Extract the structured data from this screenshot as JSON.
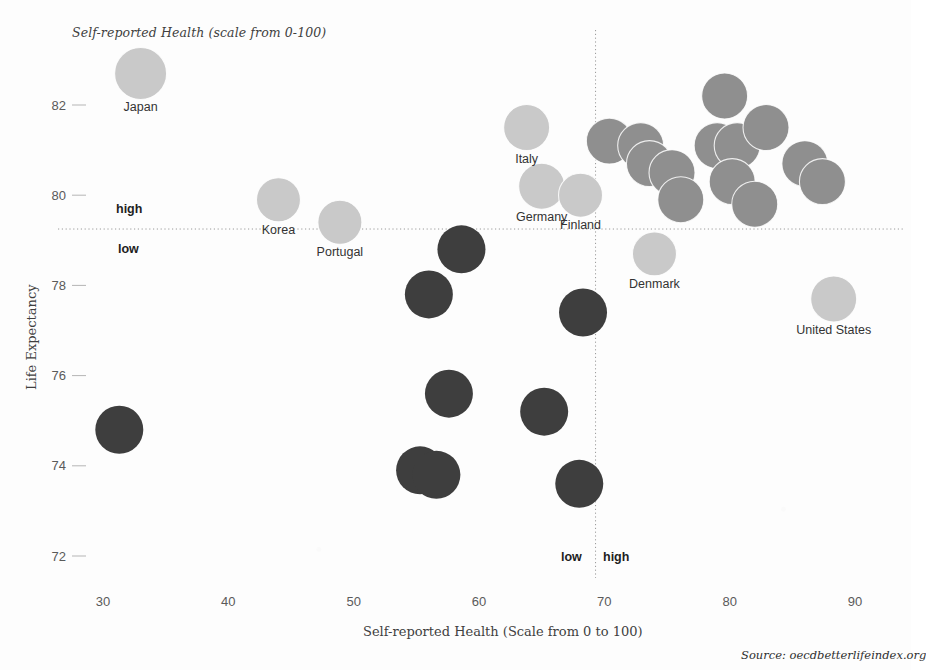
{
  "legend": {
    "bubble_size_note": "Self-reported Health (scale from 0-100)"
  },
  "axes": {
    "x_title": "Self-reported Health (Scale from 0 to 100)",
    "y_title": "Life Expectancy",
    "x_ticks": [
      "30",
      "40",
      "50",
      "60",
      "70",
      "80",
      "90"
    ],
    "y_ticks": [
      "82",
      "80",
      "78",
      "76",
      "74",
      "72"
    ]
  },
  "quadrant_labels": {
    "y_high": "high",
    "y_low": "low",
    "x_low": "low",
    "x_high": "high"
  },
  "footer": {
    "source": "Source: oecdbetterlifeindex.org"
  },
  "colors": {
    "light_bubble": "#c9c9c9",
    "mid_bubble": "#8f8f8f",
    "dark_bubble": "#3e3e3e",
    "reference_line": "#9a9a9a",
    "tick_text": "#5a5a5a",
    "label_text": "#333333",
    "background": "#fdfdfd"
  },
  "chart_data": {
    "type": "scatter",
    "title": "",
    "xlabel": "Self-reported Health (Scale from 0 to 100)",
    "ylabel": "Life Expectancy",
    "xlim": [
      26,
      94
    ],
    "ylim": [
      71.2,
      83.6
    ],
    "grid": false,
    "legend_position": "none",
    "bubble_encoding": "Bubble area encodes Self-reported Health (scale from 0-100)",
    "reference_lines": {
      "x": 69.3,
      "y": 79.25,
      "style": "dotted",
      "note": "OECD average crosshair splitting plot into four quadrants"
    },
    "color_groups": [
      {
        "name": "light",
        "hex": "#c9c9c9",
        "meaning": "high self-reported health / labelled highlight"
      },
      {
        "name": "mid",
        "hex": "#8f8f8f",
        "meaning": "mid range"
      },
      {
        "name": "dark",
        "hex": "#3e3e3e",
        "meaning": "low self-reported health"
      }
    ],
    "points": [
      {
        "label": "Japan",
        "x": 33.0,
        "y": 82.7,
        "r": 26,
        "group": "light",
        "label_pos": "below"
      },
      {
        "label": "Korea",
        "x": 44.0,
        "y": 79.9,
        "r": 22,
        "group": "light",
        "label_pos": "below"
      },
      {
        "label": "Portugal",
        "x": 48.9,
        "y": 79.4,
        "r": 22,
        "group": "light",
        "label_pos": "below"
      },
      {
        "label": "Italy",
        "x": 63.8,
        "y": 81.5,
        "r": 23,
        "group": "light",
        "label_pos": "below"
      },
      {
        "label": "Germany",
        "x": 65.0,
        "y": 80.2,
        "r": 23,
        "group": "light",
        "label_pos": "below"
      },
      {
        "label": "Finland",
        "x": 68.1,
        "y": 80.0,
        "r": 22,
        "group": "light",
        "label_pos": "below"
      },
      {
        "label": "Denmark",
        "x": 74.0,
        "y": 78.7,
        "r": 22,
        "group": "light",
        "label_pos": "below"
      },
      {
        "label": "United States",
        "x": 88.3,
        "y": 77.7,
        "r": 23,
        "group": "light",
        "label_pos": "below"
      },
      {
        "label": "",
        "x": 70.4,
        "y": 81.2,
        "r": 23,
        "group": "mid"
      },
      {
        "label": "",
        "x": 72.9,
        "y": 81.1,
        "r": 23,
        "group": "mid"
      },
      {
        "label": "",
        "x": 73.6,
        "y": 80.7,
        "r": 23,
        "group": "mid"
      },
      {
        "label": "",
        "x": 75.4,
        "y": 80.5,
        "r": 23,
        "group": "mid"
      },
      {
        "label": "",
        "x": 76.1,
        "y": 79.9,
        "r": 23,
        "group": "mid"
      },
      {
        "label": "",
        "x": 79.6,
        "y": 82.2,
        "r": 23,
        "group": "mid"
      },
      {
        "label": "",
        "x": 79.0,
        "y": 81.1,
        "r": 23,
        "group": "mid"
      },
      {
        "label": "",
        "x": 80.6,
        "y": 81.1,
        "r": 23,
        "group": "mid"
      },
      {
        "label": "",
        "x": 80.2,
        "y": 80.3,
        "r": 23,
        "group": "mid"
      },
      {
        "label": "",
        "x": 82.9,
        "y": 81.5,
        "r": 23,
        "group": "mid"
      },
      {
        "label": "",
        "x": 82.0,
        "y": 79.8,
        "r": 23,
        "group": "mid"
      },
      {
        "label": "",
        "x": 86.0,
        "y": 80.7,
        "r": 23,
        "group": "mid"
      },
      {
        "label": "",
        "x": 87.4,
        "y": 80.3,
        "r": 23,
        "group": "mid"
      },
      {
        "label": "",
        "x": 58.6,
        "y": 78.8,
        "r": 24,
        "group": "dark"
      },
      {
        "label": "",
        "x": 56.0,
        "y": 77.8,
        "r": 24,
        "group": "dark"
      },
      {
        "label": "",
        "x": 68.3,
        "y": 77.4,
        "r": 24,
        "group": "dark"
      },
      {
        "label": "",
        "x": 57.6,
        "y": 75.6,
        "r": 24,
        "group": "dark"
      },
      {
        "label": "",
        "x": 65.2,
        "y": 75.2,
        "r": 24,
        "group": "dark"
      },
      {
        "label": "",
        "x": 55.3,
        "y": 73.9,
        "r": 24,
        "group": "dark"
      },
      {
        "label": "",
        "x": 56.6,
        "y": 73.8,
        "r": 24,
        "group": "dark"
      },
      {
        "label": "",
        "x": 68.0,
        "y": 73.6,
        "r": 24,
        "group": "dark"
      },
      {
        "label": "",
        "x": 31.3,
        "y": 74.8,
        "r": 24,
        "group": "dark"
      }
    ]
  }
}
